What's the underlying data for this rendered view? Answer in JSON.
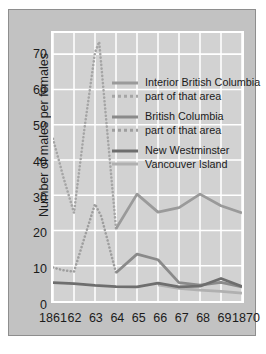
{
  "chart_data": {
    "type": "line",
    "title": "",
    "xlabel": "",
    "ylabel": "Number of males per females",
    "x": [
      1861,
      1862,
      1863,
      1864,
      1865,
      1866,
      1867,
      1868,
      1869,
      1870
    ],
    "xtick_labels": [
      "1861",
      "62",
      "63",
      "64",
      "65",
      "66",
      "67",
      "68",
      "69",
      "1870"
    ],
    "ytick_labels": [
      "0",
      "10",
      "20",
      "30",
      "40",
      "50",
      "60",
      "70"
    ],
    "yticks": [
      0,
      10,
      20,
      30,
      40,
      50,
      60,
      70
    ],
    "ylim": [
      0,
      76
    ],
    "xlim": [
      1861,
      1870
    ],
    "grid": true,
    "legend_position": "upper-center-right",
    "series": [
      {
        "name": "Interior British Columbia",
        "style": "solid",
        "color": "#9a9a9a",
        "x": [
          1864,
          1865,
          1866,
          1867,
          1868,
          1869,
          1870
        ],
        "values": [
          20.5,
          30.3,
          25.2,
          26.5,
          30.3,
          27.0,
          25.0
        ]
      },
      {
        "name": "part of that area",
        "style": "dotted",
        "color": "#a5a5a5",
        "x": [
          1861,
          1861.5,
          1862,
          1862.5,
          1863,
          1863.2,
          1864
        ],
        "values": [
          46.0,
          35.0,
          25.0,
          49.0,
          70.5,
          73.5,
          20.5
        ]
      },
      {
        "name": "British Columbia",
        "style": "solid",
        "color": "#8a8a8a",
        "x": [
          1864,
          1865,
          1866,
          1867,
          1868,
          1869,
          1870
        ],
        "values": [
          8.0,
          13.3,
          11.7,
          5.2,
          4.5,
          5.3,
          4.0
        ]
      },
      {
        "name": "part of that area",
        "style": "dotted",
        "color": "#9e9e9e",
        "x": [
          1861,
          1861.5,
          1862,
          1862.5,
          1863,
          1863.3,
          1864
        ],
        "values": [
          9.5,
          8.7,
          8.3,
          18.0,
          27.5,
          24.0,
          8.0
        ]
      },
      {
        "name": "New Westminster",
        "style": "solid",
        "color": "#6e6e6e",
        "x": [
          1861,
          1862,
          1863,
          1864,
          1865,
          1866,
          1867,
          1868,
          1869,
          1870
        ],
        "values": [
          5.2,
          4.9,
          4.4,
          4.1,
          4.0,
          5.1,
          4.0,
          4.2,
          6.4,
          4.1
        ]
      },
      {
        "name": "Vancouver Island",
        "style": "solid",
        "color": "#b0b0b0",
        "x": [
          1866,
          1867,
          1868,
          1869,
          1870
        ],
        "values": [
          4.6,
          3.6,
          3.1,
          2.7,
          2.2
        ]
      }
    ],
    "legend": [
      {
        "label": "Interior British Columbia",
        "style": "solid",
        "color": "#9a9a9a"
      },
      {
        "label": "part of that area",
        "style": "dotted",
        "color": "#a5a5a5"
      },
      {
        "label": "British Columbia",
        "style": "solid",
        "color": "#8a8a8a"
      },
      {
        "label": "part of that area",
        "style": "dotted",
        "color": "#9e9e9e"
      },
      {
        "label": "New Westminster",
        "style": "solid",
        "color": "#6e6e6e"
      },
      {
        "label": "Vancouver Island",
        "style": "solid",
        "color": "#b0b0b0"
      }
    ],
    "colors": {
      "frame": "#c2c2c2",
      "plot_bg": "#d2d2d2",
      "plot_border": "#ffffff",
      "grid": "#ffffff",
      "text": "#1b1b1b"
    }
  }
}
